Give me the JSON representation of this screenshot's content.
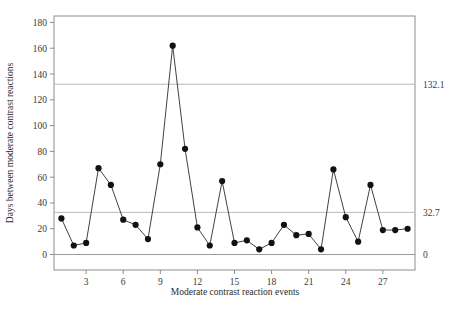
{
  "chart_data": {
    "type": "line",
    "title": "",
    "subtitle": "",
    "xlabel": "Moderate contrast reaction events",
    "ylabel": "Days between moderate contrast reactions",
    "x": [
      1,
      2,
      3,
      4,
      5,
      6,
      7,
      8,
      9,
      10,
      11,
      12,
      13,
      14,
      15,
      16,
      17,
      18,
      19,
      20,
      21,
      22,
      23,
      24,
      25,
      26,
      27,
      28,
      29
    ],
    "values": [
      28,
      7,
      9,
      67,
      54,
      27,
      23,
      12,
      70,
      162,
      82,
      21,
      7,
      57,
      9,
      11,
      4,
      9,
      23,
      15,
      16,
      4,
      66,
      29,
      10,
      54,
      19,
      19,
      20
    ],
    "series": [
      {
        "name": "Days between moderate contrast reactions",
        "values": [
          28,
          7,
          9,
          67,
          54,
          27,
          23,
          12,
          70,
          162,
          82,
          21,
          7,
          57,
          9,
          11,
          4,
          9,
          23,
          15,
          16,
          4,
          66,
          29,
          10,
          54,
          19,
          19,
          20
        ]
      }
    ],
    "xlim": [
      0.4,
      29.6
    ],
    "ylim": [
      -12,
      185
    ],
    "yticks": [
      0,
      20,
      40,
      60,
      80,
      100,
      120,
      140,
      160,
      180
    ],
    "ytick_labels": [
      "0",
      "20",
      "40",
      "60",
      "80",
      "100",
      "120",
      "140",
      "160",
      "180"
    ],
    "xticks": [
      3,
      6,
      9,
      12,
      15,
      18,
      21,
      24,
      27
    ],
    "xtick_labels": [
      "3",
      "6",
      "9",
      "12",
      "15",
      "18",
      "21",
      "24",
      "27"
    ],
    "grid": false,
    "legend": false,
    "legend_position": "none",
    "marker": "filled-circle",
    "line_color": "#2b2b2b",
    "marker_color": "#111111",
    "reference_lines": [
      {
        "name": "upper-control-limit",
        "value": 132.1,
        "label": "132.1",
        "color": "#b9b9b9"
      },
      {
        "name": "center-line",
        "value": 32.7,
        "label": "32.7",
        "color": "#b9b9b9"
      },
      {
        "name": "lower-control-limit",
        "value": 0,
        "label": "0",
        "color": "#9a9a9a"
      }
    ],
    "annotations": []
  },
  "figure": {
    "caption_fragment": ""
  }
}
